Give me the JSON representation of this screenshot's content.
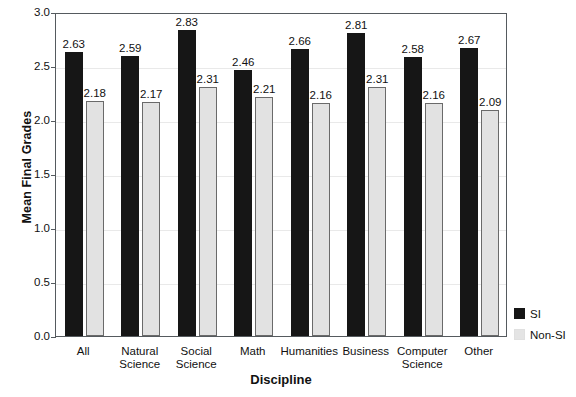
{
  "chart_data": {
    "type": "bar",
    "title": "",
    "xlabel": "Discipline",
    "ylabel": "Mean Final Grades",
    "ylim": [
      0.0,
      3.0
    ],
    "ytick_labels": [
      "0.0",
      "0.5",
      "1.0",
      "1.5",
      "2.0",
      "2.5",
      "3.0"
    ],
    "ytick_values": [
      0.0,
      0.5,
      1.0,
      1.5,
      2.0,
      2.5,
      3.0
    ],
    "grid": true,
    "legend_position": "right-bottom",
    "categories": [
      "All",
      "Natural Science",
      "Social Science",
      "Math",
      "Humanities",
      "Business",
      "Computer Science",
      "Other"
    ],
    "category_lines": [
      [
        "All"
      ],
      [
        "Natural",
        "Science"
      ],
      [
        "Social",
        "Science"
      ],
      [
        "Math"
      ],
      [
        "Humanities"
      ],
      [
        "Business"
      ],
      [
        "Computer",
        "Science"
      ],
      [
        "Other"
      ]
    ],
    "series": [
      {
        "name": "SI",
        "color": "#161616",
        "values": [
          2.63,
          2.59,
          2.83,
          2.46,
          2.66,
          2.81,
          2.58,
          2.67
        ],
        "labels": [
          "2.63",
          "2.59",
          "2.83",
          "2.46",
          "2.66",
          "2.81",
          "2.58",
          "2.67"
        ]
      },
      {
        "name": "Non-SI",
        "color": "#e2e2e2",
        "values": [
          2.18,
          2.17,
          2.31,
          2.21,
          2.16,
          2.31,
          2.16,
          2.09
        ],
        "labels": [
          "2.18",
          "2.17",
          "2.31",
          "2.21",
          "2.16",
          "2.31",
          "2.16",
          "2.09"
        ]
      }
    ]
  },
  "legend": {
    "items": [
      {
        "label": "SI",
        "color": "#161616"
      },
      {
        "label": "Non-SI",
        "color": "#e4e4e4"
      }
    ]
  }
}
